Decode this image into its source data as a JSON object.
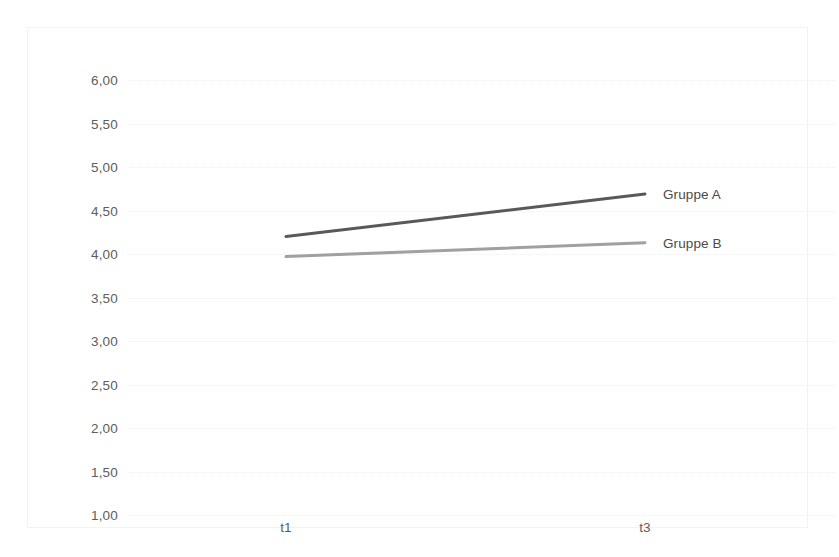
{
  "chart_data": {
    "type": "line",
    "title": "",
    "xlabel": "",
    "ylabel": "",
    "categories": [
      "t1",
      "t3"
    ],
    "x": [
      0,
      1
    ],
    "series": [
      {
        "name": "Gruppe A",
        "values": [
          4.2,
          4.69
        ],
        "color": "#595959"
      },
      {
        "name": "Gruppe B",
        "values": [
          3.97,
          4.13
        ],
        "color": "#a0a0a0"
      }
    ],
    "ylim": [
      1.0,
      6.0
    ],
    "ytick_values": [
      6.0,
      5.5,
      5.0,
      4.5,
      4.0,
      3.5,
      3.0,
      2.5,
      2.0,
      1.5,
      1.0
    ],
    "ytick_labels": [
      "6,00",
      "5,50",
      "5,00",
      "4,50",
      "4,00",
      "3,50",
      "3,00",
      "2,50",
      "2,00",
      "1,50",
      "1,00"
    ],
    "xtick_labels": [
      "t1",
      "t3"
    ],
    "grid": true,
    "grid_axis": "y",
    "legend_position": "inline-right",
    "decimal_separator": ",",
    "markers": false,
    "frame_border_color": "#f2f2f2",
    "gridline_color": "#f0f0f0",
    "tick_label_color": "#5d5d5d",
    "background_color": "#ffffff"
  },
  "labels": {
    "series_a": "Gruppe A",
    "series_b": "Gruppe B",
    "xtick_1": "t1",
    "xtick_2": "t3",
    "ytick_0": "6,00",
    "ytick_1": "5,50",
    "ytick_2": "5,00",
    "ytick_3": "4,50",
    "ytick_4": "4,00",
    "ytick_5": "3,50",
    "ytick_6": "3,00",
    "ytick_7": "2,50",
    "ytick_8": "2,00",
    "ytick_9": "1,50",
    "ytick_10": "1,00"
  }
}
